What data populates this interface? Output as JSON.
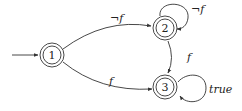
{
  "diagram": {
    "type": "state-machine",
    "states": [
      {
        "id": "1",
        "label": "1",
        "accepting": true,
        "initial": true
      },
      {
        "id": "2",
        "label": "2",
        "accepting": true,
        "initial": false
      },
      {
        "id": "3",
        "label": "3",
        "accepting": true,
        "initial": false
      }
    ],
    "transitions": [
      {
        "from": "1",
        "to": "2",
        "label": "¬f"
      },
      {
        "from": "2",
        "to": "2",
        "label": "¬f"
      },
      {
        "from": "2",
        "to": "3",
        "label": "f"
      },
      {
        "from": "1",
        "to": "3",
        "label": "f"
      },
      {
        "from": "3",
        "to": "3",
        "label": "true"
      }
    ]
  }
}
